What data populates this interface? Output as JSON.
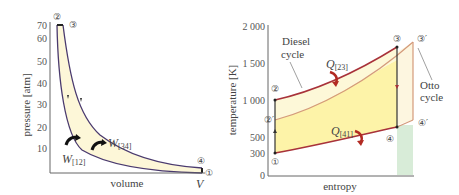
{
  "left_plot": {
    "ylabel": "pressure [atm]",
    "xlabel": "volume",
    "x_end_label": "V",
    "yticks": [
      "70",
      "60",
      "50",
      "40",
      "30",
      "20",
      "10"
    ],
    "points": {
      "p1": "①",
      "p2": "②",
      "p3": "③",
      "p4": "④"
    },
    "work_labels": {
      "w12": "W",
      "w12_sub": "[12]",
      "w34": "W",
      "w34_sub": "[34]"
    },
    "colors": {
      "curve": "#4a3a6e",
      "fill": "#fdf7d8",
      "arrow": "#1a1a1a"
    }
  },
  "right_plot": {
    "ylabel": "temperature [K]",
    "xlabel": "entropy",
    "yticks": [
      "2 000",
      "1 500",
      "1 000",
      "500",
      "300",
      "0"
    ],
    "points": {
      "p1": "①",
      "p2": "②",
      "p2p": "②′",
      "p3": "③",
      "p3p": "③′",
      "p4": "④",
      "p4p": "④′"
    },
    "heat_labels": {
      "q23": "Q",
      "q23_sub": "[23]",
      "q41": "Q",
      "q41_sub": "[41]"
    },
    "annotations": {
      "diesel_line1": "Diesel",
      "diesel_line2": "cycle",
      "otto_line1": "Otto",
      "otto_line2": "cycle"
    },
    "colors": {
      "diesel_curve": "#a8323a",
      "otto_curve": "#d49a7a",
      "diesel_fill": "#fdf3a8",
      "otto_fill": "#fdf6e0",
      "green_fill": "#d8ecd8",
      "arrow": "#b22a22"
    }
  }
}
